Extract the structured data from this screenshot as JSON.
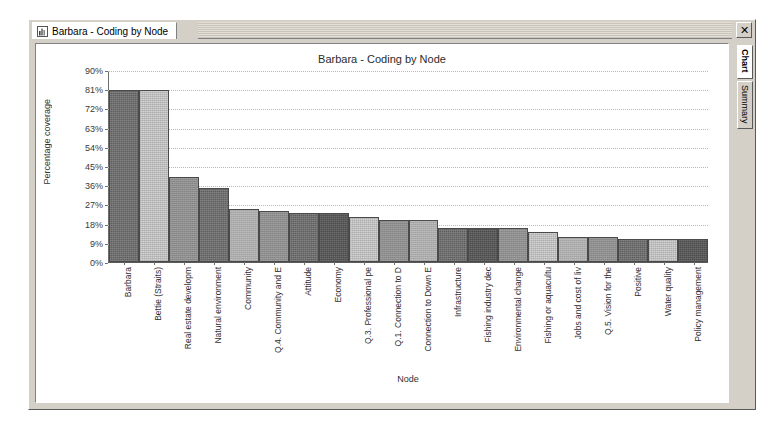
{
  "window": {
    "document_tab_label": "Barbara - Coding by Node",
    "document_tab_icon": "document-chart-icon",
    "close_label": "✕"
  },
  "side_tabs": [
    {
      "label": "Chart",
      "state": "active"
    },
    {
      "label": "Summary",
      "state": "inactive"
    }
  ],
  "colors": {
    "window_face": "#d4d0c8",
    "canvas": "#ffffff",
    "bar_dark": "#5f5f5f",
    "bar_light": "#d2d2d2",
    "bar_mid": "#8e8e8e",
    "bar_midlight": "#b4b4b4",
    "bar_darkest": "#4c4c4c",
    "gridline": "#b9b9b9",
    "axis": "#5a5a5a",
    "text": "#2f2f2f"
  },
  "chart_data": {
    "type": "bar",
    "title": "Barbara - Coding by Node",
    "xlabel": "Node",
    "ylabel": "Percentage coverage",
    "ylim": [
      0,
      90
    ],
    "ytick_values": [
      0,
      9,
      18,
      27,
      36,
      45,
      54,
      63,
      72,
      81,
      90
    ],
    "ytick_labels": [
      "0%",
      "9%",
      "18%",
      "27%",
      "36%",
      "45%",
      "54%",
      "63%",
      "72%",
      "81%",
      "90%"
    ],
    "grid": true,
    "legend": "none",
    "categories": [
      "Barbara",
      "Bettie (Straits)",
      "Real estate developm",
      "Natural environment",
      "Community",
      "Q.4. Community and E",
      "Attitude",
      "Economy",
      "Q.3. Professional pe",
      "Q.1. Connection to D",
      "Connection to Down E",
      "Infrastructure",
      "Fishing industry dec",
      "Environmental change",
      "Fishing or aquacultu",
      "Jobs and cost of liv",
      "Q.5. Vision for the",
      "Positive",
      "Water quality",
      "Policy management"
    ],
    "values": [
      81,
      81,
      40,
      35,
      25,
      24,
      23,
      23,
      21,
      20,
      20,
      16,
      16,
      16,
      14,
      12,
      12,
      11,
      11,
      11
    ],
    "bar_styles": [
      "fill-dark",
      "fill-light",
      "fill-mid",
      "fill-dark",
      "fill-midlight",
      "fill-mid",
      "fill-dark",
      "fill-darkest",
      "fill-light",
      "fill-mid",
      "fill-midlight",
      "fill-dark",
      "fill-darkest",
      "fill-mid",
      "fill-light",
      "fill-midlight",
      "fill-mid",
      "fill-dark",
      "fill-light",
      "fill-darkest"
    ]
  }
}
